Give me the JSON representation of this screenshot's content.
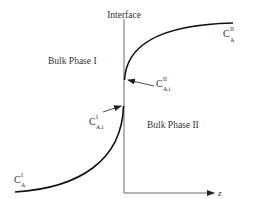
{
  "diagram": {
    "interface_label": "Interface",
    "phase_1_label": "Bulk Phase I",
    "phase_2_label": "Bulk Phase II",
    "axis_label": "z",
    "labels": {
      "bulk_conc_phase_2": {
        "base": "C",
        "sup": "II",
        "sub": "A"
      },
      "interface_conc_phase_2": {
        "base": "C",
        "sup": "II",
        "sub": "A,i"
      },
      "interface_conc_phase_1": {
        "base": "C",
        "sup": "I",
        "sub": "A,i"
      },
      "bulk_conc_phase_1": {
        "base": "C",
        "sup": "I",
        "sub": "A"
      }
    },
    "colors": {
      "line": "#111111",
      "text": "#333333",
      "background": "#ffffff"
    }
  }
}
